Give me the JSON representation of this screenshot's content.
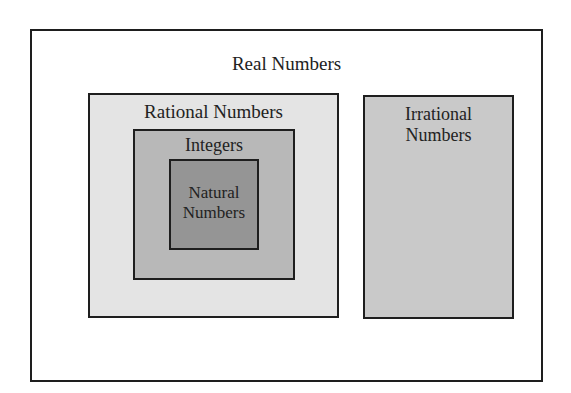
{
  "diagram": {
    "title": "Real Numbers",
    "sets": [
      {
        "id": "real",
        "label": "Real Numbers",
        "fill": "#ffffff",
        "contains": [
          "rational",
          "irrational"
        ]
      },
      {
        "id": "rational",
        "label": "Rational Numbers",
        "fill": "#e4e4e4",
        "contains": [
          "integers"
        ]
      },
      {
        "id": "integers",
        "label": "Integers",
        "fill": "#b8b8b8",
        "contains": [
          "natural"
        ]
      },
      {
        "id": "natural",
        "label_lines": [
          "Natural",
          "Numbers"
        ],
        "fill": "#959595",
        "contains": []
      },
      {
        "id": "irrational",
        "label_lines": [
          "Irrational",
          "Numbers"
        ],
        "fill": "#c9c9c9",
        "contains": []
      }
    ]
  },
  "labels": {
    "real": "Real Numbers",
    "rational": "Rational Numbers",
    "integers": "Integers",
    "natural_1": "Natural",
    "natural_2": "Numbers",
    "irrational_1": "Irrational",
    "irrational_2": "Numbers"
  }
}
